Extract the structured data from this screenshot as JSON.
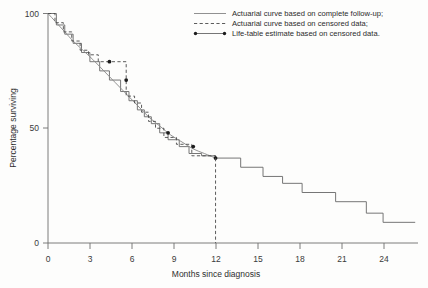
{
  "figure": {
    "background_color": "#fdfdfc",
    "width": 428,
    "height": 288
  },
  "axes": {
    "x": {
      "label": "Months since diagnosis",
      "ticks": [
        0,
        3,
        6,
        9,
        12,
        15,
        18,
        21,
        24
      ],
      "tick_labels": [
        "0",
        "3",
        "6",
        "9",
        "12",
        "15",
        "18",
        "21",
        "24"
      ],
      "range": [
        0,
        26.5
      ]
    },
    "y": {
      "label": "Percentage surviving",
      "ticks": [
        0,
        50,
        100
      ],
      "tick_labels": [
        "0",
        "50",
        "100"
      ],
      "range": [
        0,
        100
      ]
    }
  },
  "legend": {
    "position": "top-right",
    "entries": [
      {
        "marker": "solid-line",
        "label": "Actuarial curve based on complete follow-up;",
        "color": "#8b8b8b"
      },
      {
        "marker": "dashed-line",
        "label": "Actuarial curve based on censored data;",
        "color": "#4a4a4a"
      },
      {
        "marker": "dotted-endpoint-line",
        "label": "Life-table estimate based on censored data.",
        "color": "#6f6f6f"
      }
    ]
  },
  "chart_data": {
    "type": "line",
    "title": "",
    "subtitle": "",
    "xlabel": "Months since diagnosis",
    "ylabel": "Percentage surviving",
    "xlim": [
      0,
      26.5
    ],
    "ylim": [
      0,
      100
    ],
    "grid": false,
    "legend_position": "top-right",
    "series": [
      {
        "name": "Actuarial curve based on complete follow-up",
        "style": "solid",
        "shape": "smooth",
        "color": "#8b8b8b",
        "x": [
          0,
          0.6,
          1.2,
          1.8,
          2.5,
          3.2,
          4.0,
          4.8,
          5.6,
          6.4,
          7.2,
          8.0,
          8.8,
          9.6,
          10.4,
          11.2,
          12.0
        ],
        "y": [
          100,
          96,
          92,
          88,
          84,
          80,
          75,
          70,
          65,
          60,
          55,
          51,
          47,
          44,
          41,
          39,
          37
        ]
      },
      {
        "name": "Actuarial curve based on censored data",
        "style": "dashed",
        "shape": "step",
        "color": "#4a4a4a",
        "x": [
          0,
          0.5,
          0.5,
          1.1,
          1.1,
          1.7,
          1.7,
          2.3,
          2.3,
          2.9,
          2.9,
          3.6,
          3.6,
          4.3,
          4.3,
          5.6,
          5.6,
          6.2,
          6.2,
          6.7,
          6.7,
          7.2,
          7.2,
          7.7,
          7.7,
          8.3,
          8.3,
          9.2,
          9.2,
          10.3,
          10.3,
          12.0,
          12.0
        ],
        "y": [
          100,
          100,
          96,
          96,
          92,
          92,
          88,
          88,
          84,
          84,
          82,
          82,
          79,
          79,
          79,
          79,
          64,
          64,
          61,
          61,
          57,
          57,
          53,
          53,
          50,
          50,
          46,
          46,
          43,
          43,
          38,
          38,
          37
        ]
      },
      {
        "name": "Life-table estimate based on censored data",
        "style": "solid-step",
        "shape": "step",
        "color": "#6f6f6f",
        "x": [
          0,
          0.6,
          0.6,
          1.2,
          1.2,
          1.8,
          1.8,
          2.4,
          2.4,
          3.0,
          3.0,
          3.7,
          3.7,
          4.4,
          4.4,
          5.2,
          5.2,
          5.8,
          5.8,
          6.4,
          6.4,
          6.9,
          6.9,
          7.4,
          7.4,
          8.0,
          8.0,
          8.6,
          8.6,
          9.4,
          9.4,
          10.1,
          10.1,
          11.0,
          11.0,
          12.0,
          12.0,
          13.8,
          13.8,
          15.4,
          15.4,
          16.8,
          16.8,
          18.2,
          18.2,
          20.6,
          20.6,
          22.8,
          22.8,
          24.0,
          24.0,
          26.3
        ],
        "y": [
          100,
          100,
          95,
          95,
          91,
          91,
          87,
          87,
          83,
          83,
          79,
          79,
          75,
          75,
          71,
          71,
          66,
          66,
          62,
          62,
          58,
          58,
          55,
          55,
          52,
          52,
          48,
          48,
          45,
          45,
          42,
          42,
          39,
          39,
          38,
          38,
          37,
          37,
          33,
          33,
          29,
          29,
          26,
          26,
          22,
          22,
          18,
          18,
          13,
          13,
          9,
          9
        ]
      }
    ],
    "markers": [
      {
        "series": "Life-table estimate based on censored data",
        "x": 4.4,
        "y": 79,
        "label": ""
      },
      {
        "series": "Life-table estimate based on censored data",
        "x": 5.6,
        "y": 71,
        "label": ""
      },
      {
        "series": "Life-table estimate based on censored data",
        "x": 8.6,
        "y": 48,
        "label": ""
      },
      {
        "series": "Life-table estimate based on censored data",
        "x": 10.4,
        "y": 42,
        "label": ""
      },
      {
        "series": "Life-table estimate based on censored data",
        "x": 12.0,
        "y": 37,
        "label": ""
      }
    ],
    "annotations": [
      {
        "type": "dashed-vertical",
        "x": 12.0,
        "y_from": 37,
        "y_to": 0
      }
    ]
  }
}
